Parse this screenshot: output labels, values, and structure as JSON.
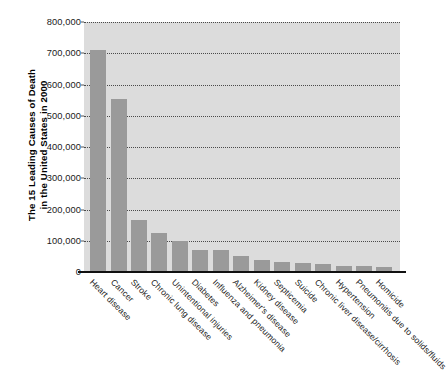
{
  "chart_data": {
    "type": "bar",
    "title": "",
    "ylabel": "The 15 Leading Causes of Death\nin the United States in 2000",
    "xlabel": "",
    "ylim": [
      0,
      800000
    ],
    "grid": true,
    "legend": "none",
    "bar_color": "#9a9a9a",
    "plot_background": "#dcdcdc",
    "figure_background": "#ffffff",
    "gridline_color": "#4a4a4a",
    "axis_color": "#111111",
    "yticks": [
      "0",
      "100,000",
      "200,000",
      "300,000",
      "400,000",
      "500,000",
      "600,000",
      "700,000",
      "800,000"
    ],
    "ytick_values": [
      0,
      100000,
      200000,
      300000,
      400000,
      500000,
      600000,
      700000,
      800000
    ],
    "categories": [
      "Heart disease",
      "Cancer",
      "Stroke",
      "Chronic lung disease",
      "Unintentional injuries",
      "Diabetes",
      "Influenza and pneumonia",
      "Alzheimer's disease",
      "Kidney disease",
      "Septicemia",
      "Suicide",
      "Chronic liver disease/cirrhosis",
      "Hypertension",
      "Pneumonitis due to solids/fluids",
      "Homicide"
    ],
    "values": [
      710000,
      553000,
      167000,
      124000,
      98000,
      70000,
      69000,
      50000,
      37000,
      31000,
      30000,
      27000,
      19000,
      18000,
      17000
    ]
  }
}
